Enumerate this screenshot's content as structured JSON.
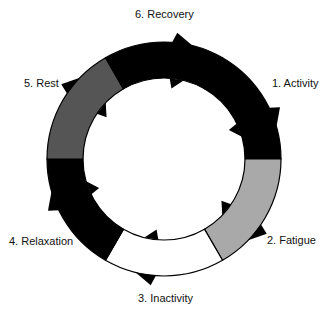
{
  "diagram": {
    "type": "cycle",
    "center": [
      164,
      159
    ],
    "outer_radius": 117,
    "inner_radius": 81,
    "stroke_color": "#000000",
    "segments": [
      {
        "id": "activity",
        "label": "1. Activity",
        "start_deg": -60,
        "end_deg": 0,
        "color": "#000000",
        "label_pos": [
          272,
          77
        ]
      },
      {
        "id": "fatigue",
        "label": "2. Fatigue",
        "start_deg": 0,
        "end_deg": 60,
        "color": "#a9a9a9",
        "label_pos": [
          267,
          234
        ]
      },
      {
        "id": "inactivity",
        "label": "3. Inactivity",
        "start_deg": 60,
        "end_deg": 120,
        "color": "#ffffff",
        "label_pos": [
          138,
          292
        ]
      },
      {
        "id": "relaxation",
        "label": "4. Relaxation",
        "start_deg": 120,
        "end_deg": 180,
        "color": "#000000",
        "label_pos": [
          9,
          235
        ]
      },
      {
        "id": "rest",
        "label": "5. Rest",
        "start_deg": 180,
        "end_deg": 240,
        "color": "#555555",
        "label_pos": [
          24,
          77
        ]
      },
      {
        "id": "recovery",
        "label": "6. Recovery",
        "start_deg": 240,
        "end_deg": 300,
        "color": "#000000",
        "label_pos": [
          135,
          8
        ]
      }
    ]
  }
}
